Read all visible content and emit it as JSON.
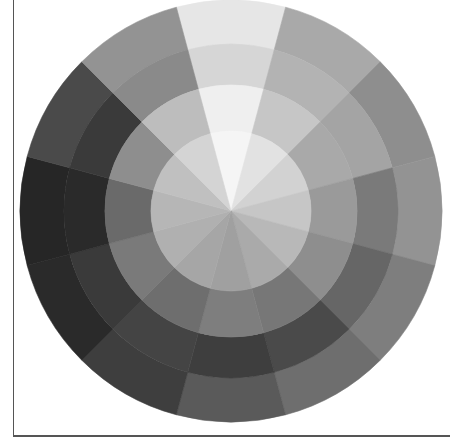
{
  "figure": {
    "center": [
      231,
      211
    ],
    "start_angle_deg": -105,
    "sector_count": 12,
    "sector_angle_deg": 30,
    "rings": [
      {
        "name": "outer-ring",
        "r_inner": 167,
        "r_outer": 211,
        "colors": [
          "#e6e6e6",
          "#a9a9a9",
          "#8e8e8e",
          "#939393",
          "#7e7e7e",
          "#6e6e6e",
          "#5a5a5a",
          "#3e3e3e",
          "#2a2a2a",
          "#262626",
          "#4a4a4a",
          "#939393"
        ]
      },
      {
        "name": "second-ring",
        "r_inner": 126,
        "r_outer": 167,
        "colors": [
          "#d6d6d6",
          "#b3b3b3",
          "#a4a4a4",
          "#7a7a7a",
          "#666666",
          "#4a4a4a",
          "#3e3e3e",
          "#444444",
          "#3a3a3a",
          "#2a2a2a",
          "#3a3a3a",
          "#8a8a8a"
        ]
      },
      {
        "name": "third-ring",
        "r_inner": 80,
        "r_outer": 126,
        "colors": [
          "#efefef",
          "#c6c6c6",
          "#a9a9a9",
          "#9a9a9a",
          "#8e8e8e",
          "#777777",
          "#7e7e7e",
          "#6e6e6e",
          "#7a7a7a",
          "#6a6a6a",
          "#8e8e8e",
          "#bdbdbd"
        ]
      },
      {
        "name": "inner-disk",
        "r_inner": 0,
        "r_outer": 80,
        "colors": [
          "#f5f5f5",
          "#e2e2e2",
          "#d2d2d2",
          "#c6c6c6",
          "#b8b8b8",
          "#aaaaaa",
          "#a0a0a0",
          "#a6a6a6",
          "#b0b0b0",
          "#b6b6b6",
          "#c0c0c0",
          "#d4d4d4"
        ]
      }
    ],
    "frame_color": "#555555"
  }
}
